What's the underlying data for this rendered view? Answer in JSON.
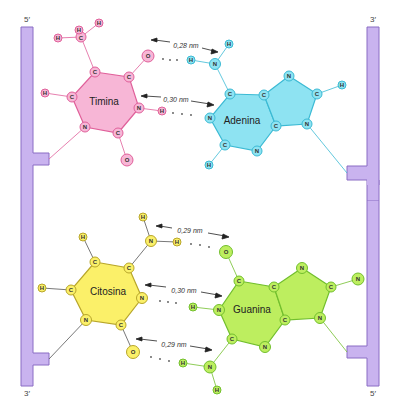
{
  "colors": {
    "backbone_fill": "#c9b3ef",
    "backbone_stroke": "#8a6cc4",
    "timina_fill": "#f7b6d6",
    "timina_stroke": "#e0609a",
    "adenina_fill": "#8ee3f2",
    "adenina_stroke": "#3bbad4",
    "citosina_fill": "#fbf069",
    "citosina_stroke": "#b8a62a",
    "guanina_fill": "#bdee5f",
    "guanina_stroke": "#72bf2d",
    "arrow": "#222222",
    "dots": "#555555"
  },
  "strands": {
    "left_top_label": "5′",
    "left_bottom_label": "3′",
    "right_top_label": "3′",
    "right_bottom_label": "5′"
  },
  "pairs": [
    {
      "name": "A-T",
      "left_base": "Timina",
      "right_base": "Adenina",
      "hydrogen_bonds": [
        {
          "distance": "0,28 nm",
          "donor": "N-H (Adenina)",
          "acceptor": "O (Timina)"
        },
        {
          "distance": "0,30 nm",
          "donor": "N-H (Timina)",
          "acceptor": "N (Adenina)"
        }
      ]
    },
    {
      "name": "G-C",
      "left_base": "Citosina",
      "right_base": "Guanina",
      "hydrogen_bonds": [
        {
          "distance": "0,29 nm",
          "donor": "N-H (Citosina)",
          "acceptor": "O (Guanina)"
        },
        {
          "distance": "0,30 nm",
          "donor": "N-H (Guanina)",
          "acceptor": "N (Citosina)"
        },
        {
          "distance": "0,29 nm",
          "donor": "N-H (Guanina)",
          "acceptor": "O (Citosina)"
        }
      ]
    }
  ],
  "bases": {
    "timina": {
      "label": "Timina",
      "atoms": [
        {
          "el": "C",
          "x": 95,
          "y": 72
        },
        {
          "el": "C",
          "x": 129,
          "y": 77
        },
        {
          "el": "N",
          "x": 139,
          "y": 108
        },
        {
          "el": "C",
          "x": 118,
          "y": 133
        },
        {
          "el": "N",
          "x": 85,
          "y": 127
        },
        {
          "el": "C",
          "x": 72,
          "y": 97
        },
        {
          "el": "O",
          "x": 148,
          "y": 56
        },
        {
          "el": "O",
          "x": 127,
          "y": 160
        },
        {
          "el": "H",
          "x": 162,
          "y": 111
        },
        {
          "el": "H",
          "x": 45,
          "y": 93
        },
        {
          "el": "C",
          "x": 81,
          "y": 37
        },
        {
          "el": "H",
          "x": 58,
          "y": 38
        },
        {
          "el": "H",
          "x": 79,
          "y": 30
        },
        {
          "el": "H",
          "x": 99,
          "y": 23
        }
      ]
    },
    "adenina": {
      "label": "Adenina",
      "atoms": [
        {
          "el": "N",
          "x": 215,
          "y": 64
        },
        {
          "el": "H",
          "x": 191,
          "y": 60
        },
        {
          "el": "H",
          "x": 229,
          "y": 44
        },
        {
          "el": "C",
          "x": 230,
          "y": 94
        },
        {
          "el": "C",
          "x": 264,
          "y": 95
        },
        {
          "el": "C",
          "x": 276,
          "y": 126
        },
        {
          "el": "N",
          "x": 257,
          "y": 151
        },
        {
          "el": "C",
          "x": 225,
          "y": 145
        },
        {
          "el": "N",
          "x": 210,
          "y": 118
        },
        {
          "el": "H",
          "x": 209,
          "y": 165
        },
        {
          "el": "N",
          "x": 289,
          "y": 76
        },
        {
          "el": "C",
          "x": 317,
          "y": 94
        },
        {
          "el": "N",
          "x": 307,
          "y": 124
        },
        {
          "el": "H",
          "x": 342,
          "y": 85
        }
      ]
    },
    "citosina": {
      "label": "Citosina",
      "atoms": [
        {
          "el": "C",
          "x": 95,
          "y": 262
        },
        {
          "el": "C",
          "x": 129,
          "y": 268
        },
        {
          "el": "N",
          "x": 142,
          "y": 298
        },
        {
          "el": "C",
          "x": 121,
          "y": 325
        },
        {
          "el": "N",
          "x": 86,
          "y": 320
        },
        {
          "el": "C",
          "x": 71,
          "y": 290
        },
        {
          "el": "N",
          "x": 151,
          "y": 241
        },
        {
          "el": "H",
          "x": 143,
          "y": 217
        },
        {
          "el": "H",
          "x": 177,
          "y": 242
        },
        {
          "el": "O",
          "x": 133,
          "y": 352
        },
        {
          "el": "H",
          "x": 83,
          "y": 237
        },
        {
          "el": "H",
          "x": 42,
          "y": 288
        }
      ]
    },
    "guanina": {
      "label": "Guanina",
      "atoms": [
        {
          "el": "O",
          "x": 226,
          "y": 252
        },
        {
          "el": "C",
          "x": 239,
          "y": 281
        },
        {
          "el": "C",
          "x": 274,
          "y": 287
        },
        {
          "el": "C",
          "x": 285,
          "y": 320
        },
        {
          "el": "N",
          "x": 265,
          "y": 347
        },
        {
          "el": "C",
          "x": 232,
          "y": 339
        },
        {
          "el": "N",
          "x": 219,
          "y": 310
        },
        {
          "el": "H",
          "x": 193,
          "y": 307
        },
        {
          "el": "N",
          "x": 210,
          "y": 367
        },
        {
          "el": "H",
          "x": 183,
          "y": 363
        },
        {
          "el": "H",
          "x": 217,
          "y": 390
        },
        {
          "el": "N",
          "x": 302,
          "y": 268
        },
        {
          "el": "C",
          "x": 331,
          "y": 287
        },
        {
          "el": "N",
          "x": 320,
          "y": 318
        },
        {
          "el": "N",
          "x": 358,
          "y": 279
        }
      ]
    }
  }
}
